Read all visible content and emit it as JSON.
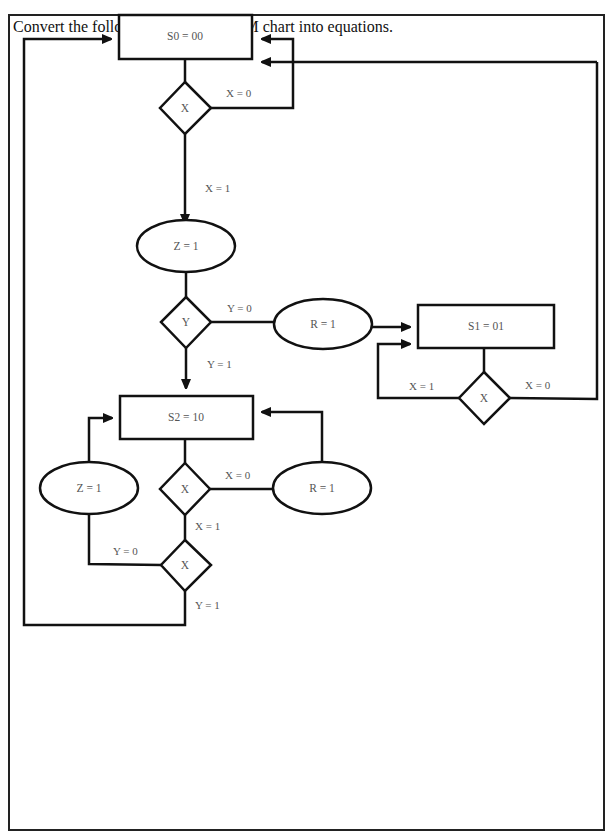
{
  "question": {
    "prompt": "Convert the following pure Mealy SM chart into equations."
  },
  "chart": {
    "states": [
      {
        "id": "S0",
        "label": "S0 = 00"
      },
      {
        "id": "S1",
        "label": "S1 = 01"
      },
      {
        "id": "S2",
        "label": "S2 = 10"
      }
    ],
    "decisions": {
      "s0_x": "X",
      "s0_y": "Y",
      "s1_x": "X",
      "s2_x": "X",
      "s2_y": "X"
    },
    "outputs": {
      "s0_z": "Z = 1",
      "s0_r": "R = 1",
      "s2_z": "Z = 1",
      "s2_r": "R = 1"
    },
    "edge_labels": {
      "s0_x0": "X = 0",
      "s0_x1": "X = 1",
      "s0_y0": "Y = 0",
      "s0_y1": "Y = 1",
      "s1_x1": "X = 1",
      "s1_x0": "X = 0",
      "s2_x0": "X = 0",
      "s2_x1": "X = 1",
      "s2_y0": "Y = 0",
      "s2_y1": "Y = 1"
    }
  }
}
